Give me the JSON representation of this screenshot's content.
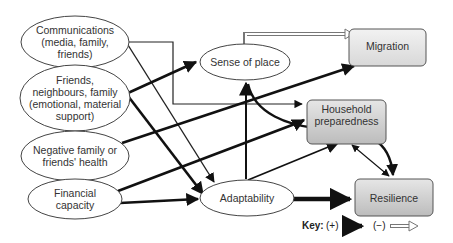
{
  "diagram": {
    "nodes": {
      "communications": {
        "label": "Communications (media, family, friends)",
        "lines": [
          "Communications",
          "(media, family,",
          "friends)"
        ]
      },
      "friends": {
        "label": "Friends, neighbours, family (emotional, material support)",
        "lines": [
          "Friends,",
          "neighbours, family",
          "(emotional, material",
          "support)"
        ]
      },
      "negative": {
        "label": "Negative family or friends' health",
        "lines": [
          "Negative family or",
          "friends' health"
        ]
      },
      "financial": {
        "label": "Financial capacity",
        "lines": [
          "Financial",
          "capacity"
        ]
      },
      "sense": {
        "label": "Sense of place"
      },
      "adaptability": {
        "label": "Adaptability"
      },
      "migration": {
        "label": "Migration"
      },
      "household": {
        "label": "Household preparedness",
        "lines": [
          "Household",
          "preparedness"
        ]
      },
      "resilience": {
        "label": "Resilience"
      }
    },
    "edges": [
      {
        "from": "communications",
        "to": "adaptability",
        "sign": "+",
        "weight": "thin"
      },
      {
        "from": "communications",
        "to": "household",
        "sign": "+",
        "weight": "thin"
      },
      {
        "from": "friends",
        "to": "sense",
        "sign": "+",
        "weight": "thick"
      },
      {
        "from": "friends",
        "to": "adaptability",
        "sign": "+",
        "weight": "thick"
      },
      {
        "from": "negative",
        "to": "migration",
        "sign": "+",
        "weight": "thick"
      },
      {
        "from": "financial",
        "to": "household",
        "sign": "+",
        "weight": "thick"
      },
      {
        "from": "financial",
        "to": "adaptability",
        "sign": "+",
        "weight": "thick"
      },
      {
        "from": "sense",
        "to": "migration",
        "sign": "-",
        "weight": "hollow"
      },
      {
        "from": "sense",
        "to": "resilience",
        "sign": "+",
        "weight": "thick"
      },
      {
        "from": "adaptability",
        "to": "sense",
        "sign": "+",
        "weight": "thick"
      },
      {
        "from": "adaptability",
        "to": "household",
        "sign": "+",
        "weight": "thick"
      },
      {
        "from": "adaptability",
        "to": "resilience",
        "sign": "+",
        "weight": "heavy"
      },
      {
        "from": "household",
        "to": "resilience",
        "sign": "+/-",
        "weight": "thin",
        "bidirectional": true
      }
    ],
    "key": {
      "title": "Key:",
      "positive": "(+)",
      "negative": "(−)"
    }
  }
}
